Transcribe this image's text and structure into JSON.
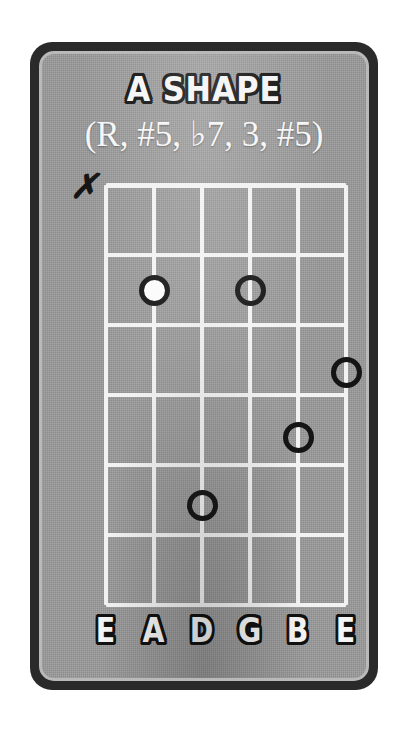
{
  "card": {
    "title": "A SHAPE",
    "intervals": "(R, #5, ♭7, 3, #5)",
    "colors": {
      "card_border": "#2a2a2a",
      "card_inner_edge": "#b9b9b9",
      "fretboard_background": "#9b9b9b",
      "grid_line": "#f2f2f2",
      "dot_ring": "#141414",
      "root_dot_fill": "#fbfbfb",
      "text_fill": "#f4f4f4",
      "text_outline": "#111111"
    }
  },
  "fretboard": {
    "string_count": 6,
    "fret_count": 6,
    "string_spacing_px": 48,
    "fret_spacing_px": 70,
    "strings": [
      {
        "index": 1,
        "label": "E",
        "x": 0
      },
      {
        "index": 2,
        "label": "A",
        "x": 48
      },
      {
        "index": 3,
        "label": "D",
        "x": 96
      },
      {
        "index": 4,
        "label": "G",
        "x": 144
      },
      {
        "index": 5,
        "label": "B",
        "x": 192
      },
      {
        "index": 6,
        "label": "E",
        "x": 240
      }
    ],
    "frets": [
      {
        "index": 0,
        "y": 0
      },
      {
        "index": 1,
        "y": 70
      },
      {
        "index": 2,
        "y": 140
      },
      {
        "index": 3,
        "y": 210
      },
      {
        "index": 4,
        "y": 280
      },
      {
        "index": 5,
        "y": 350
      },
      {
        "index": 6,
        "y": 420
      }
    ],
    "markers": [
      {
        "name": "mute",
        "string": 1,
        "symbol": "✗"
      }
    ],
    "dots": [
      {
        "string": 2,
        "fret": 2,
        "x": 48,
        "y": 105,
        "filled": true,
        "role": "root"
      },
      {
        "string": 4,
        "fret": 2,
        "x": 144,
        "y": 105,
        "filled": false,
        "role": "tone"
      },
      {
        "string": 6,
        "fret": 3,
        "x": 240,
        "y": 187,
        "filled": false,
        "role": "tone"
      },
      {
        "string": 5,
        "fret": 4,
        "x": 192,
        "y": 252,
        "filled": false,
        "role": "tone"
      },
      {
        "string": 3,
        "fret": 5,
        "x": 96,
        "y": 320,
        "filled": false,
        "role": "tone"
      }
    ]
  }
}
